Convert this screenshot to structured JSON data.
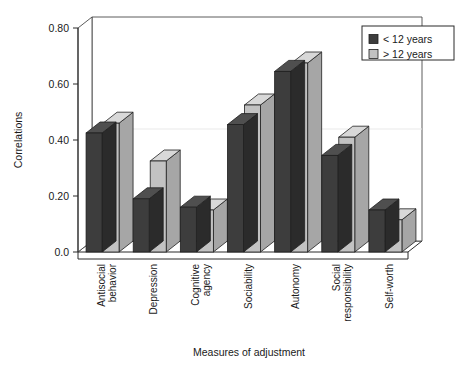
{
  "chart_data": {
    "type": "bar",
    "title": "",
    "xlabel": "Measures of adjustment",
    "ylabel": "Correlations",
    "ylim": [
      0.0,
      0.8
    ],
    "yticks": [
      "0.0",
      "0.20",
      "0.40",
      "0.60",
      "0.80"
    ],
    "ytick_values": [
      0.0,
      0.2,
      0.4,
      0.6,
      0.8
    ],
    "grid": false,
    "legend_position": "top-right",
    "style": "3d-columns",
    "categories": [
      "Antisocial behavior",
      "Depression",
      "Cognitive agency",
      "Sociability",
      "Autonomy",
      "Social responsibility",
      "Self-worth"
    ],
    "series": [
      {
        "name": "< 12 years",
        "color": "#3d3d3d",
        "top_color": "#4f4f4f",
        "side_color": "#2b2b2b",
        "values": [
          0.425,
          0.19,
          0.16,
          0.455,
          0.645,
          0.345,
          0.15
        ]
      },
      {
        "name": "> 12 years",
        "color": "#c2c2c2",
        "top_color": "#d8d8d8",
        "side_color": "#a6a6a6",
        "values": [
          0.46,
          0.325,
          0.15,
          0.525,
          0.675,
          0.41,
          0.115
        ]
      }
    ]
  },
  "legend": {
    "items": [
      {
        "label": "< 12 years",
        "swatch": "#3d3d3d"
      },
      {
        "label": "> 12 years",
        "swatch": "#c2c2c2"
      }
    ]
  },
  "axes": {
    "y_title": "Correlations",
    "x_title": "Measures of adjustment"
  }
}
